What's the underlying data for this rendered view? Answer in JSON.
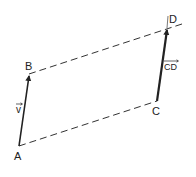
{
  "diagram": {
    "type": "vector-parallelogram",
    "colors": {
      "ink": "#222222",
      "background": "#ffffff"
    },
    "points": {
      "A": {
        "label": "A",
        "x": 19,
        "y": 146
      },
      "B": {
        "label": "B",
        "x": 29,
        "y": 74
      },
      "C": {
        "label": "C",
        "x": 157,
        "y": 101
      },
      "D": {
        "label": "D",
        "x": 167,
        "y": 28
      }
    },
    "vectors": [
      {
        "from": "A",
        "to": "B",
        "label": "v",
        "label_display": "v⃗"
      },
      {
        "from": "C",
        "to": "D",
        "label": "CD",
        "label_display": "CD"
      }
    ],
    "dashed_edges": [
      {
        "from": "B",
        "to": "D"
      },
      {
        "from": "A",
        "to": "C"
      }
    ]
  }
}
